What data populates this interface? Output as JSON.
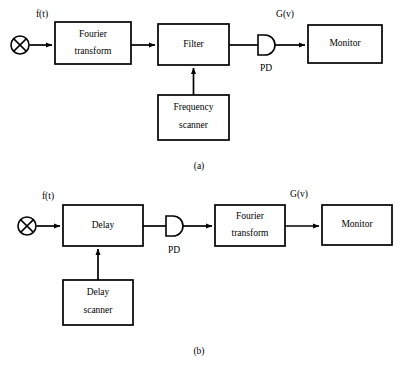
{
  "figure": {
    "type": "block-diagram",
    "background_color": "#ffffff",
    "line_color": "#000000",
    "panels": [
      {
        "id": "a",
        "caption": "(a)",
        "caption_pos": {
          "x": 199,
          "y": 166
        },
        "input_node": {
          "name": "mixer",
          "symbol": "circle-with-x",
          "cx": 20,
          "cy": 45,
          "r": 9
        },
        "input_signal_label": "f(t)",
        "input_signal_label_pos": {
          "x": 42,
          "y": 17
        },
        "output_signal_label": "G(v)",
        "output_signal_label_pos": {
          "x": 285,
          "y": 17
        },
        "detector": {
          "label": "PD",
          "shape": "d-shape",
          "x": 258,
          "y": 35,
          "w": 16,
          "h": 20,
          "label_pos": {
            "x": 266,
            "y": 68
          }
        },
        "blocks": [
          {
            "id": "fourier-transform",
            "lines": [
              "Fourier",
              "transform"
            ],
            "x": 55,
            "y": 22,
            "w": 76,
            "h": 42
          },
          {
            "id": "filter",
            "lines": [
              "Filter"
            ],
            "x": 158,
            "y": 24,
            "w": 71,
            "h": 41
          },
          {
            "id": "frequency-scanner",
            "lines": [
              "Frequency",
              "scanner"
            ],
            "x": 158,
            "y": 95,
            "w": 71,
            "h": 45
          },
          {
            "id": "monitor",
            "lines": [
              "Monitor"
            ],
            "x": 308,
            "y": 25,
            "w": 74,
            "h": 38
          }
        ],
        "connections": [
          {
            "id": "mixer-to-fourier",
            "from": "mixer",
            "to": "fourier-transform",
            "arrow": true
          },
          {
            "id": "fourier-to-filter",
            "from": "fourier-transform",
            "to": "filter",
            "arrow": true
          },
          {
            "id": "filter-to-pd",
            "from": "filter",
            "to": "pd",
            "arrow": false
          },
          {
            "id": "pd-to-monitor",
            "from": "pd",
            "to": "monitor",
            "arrow": true
          },
          {
            "id": "scanner-to-filter",
            "from": "frequency-scanner",
            "to": "filter",
            "arrow": true,
            "direction": "up"
          }
        ]
      },
      {
        "id": "b",
        "caption": "(b)",
        "caption_pos": {
          "x": 199,
          "y": 351
        },
        "input_node": {
          "name": "mixer",
          "symbol": "circle-with-x",
          "cx": 27,
          "cy": 226,
          "r": 9
        },
        "input_signal_label": "f(t)",
        "input_signal_label_pos": {
          "x": 48,
          "y": 199
        },
        "output_signal_label": "G(v)",
        "output_signal_label_pos": {
          "x": 299,
          "y": 197
        },
        "detector": {
          "label": "PD",
          "shape": "d-shape",
          "x": 166,
          "y": 216,
          "w": 16,
          "h": 20,
          "label_pos": {
            "x": 174,
            "y": 250
          }
        },
        "blocks": [
          {
            "id": "delay",
            "lines": [
              "Delay"
            ],
            "x": 63,
            "y": 205,
            "w": 80,
            "h": 41
          },
          {
            "id": "delay-scanner",
            "lines": [
              "Delay",
              "scanner"
            ],
            "x": 63,
            "y": 280,
            "w": 70,
            "h": 45
          },
          {
            "id": "fourier-transform",
            "lines": [
              "Fourier",
              "transform"
            ],
            "x": 215,
            "y": 205,
            "w": 70,
            "h": 41
          },
          {
            "id": "monitor",
            "lines": [
              "Monitor"
            ],
            "x": 322,
            "y": 205,
            "w": 70,
            "h": 40
          }
        ],
        "connections": [
          {
            "id": "mixer-to-delay",
            "from": "mixer",
            "to": "delay",
            "arrow": true
          },
          {
            "id": "delay-to-pd",
            "from": "delay",
            "to": "pd",
            "arrow": false
          },
          {
            "id": "pd-to-fourier",
            "from": "pd",
            "to": "fourier-transform",
            "arrow": true
          },
          {
            "id": "fourier-to-monitor",
            "from": "fourier-transform",
            "to": "monitor",
            "arrow": true
          },
          {
            "id": "scanner-to-delay",
            "from": "delay-scanner",
            "to": "delay",
            "arrow": true,
            "direction": "up"
          }
        ]
      }
    ]
  },
  "text": {
    "panel_a": {
      "fourier_transform_line1": "Fourier",
      "fourier_transform_line2": "transform",
      "filter": "Filter",
      "frequency_scanner_line1": "Frequency",
      "frequency_scanner_line2": "scanner",
      "monitor": "Monitor",
      "pd": "PD",
      "input_signal": "f(t)",
      "output_signal": "G(v)",
      "caption": "(a)"
    },
    "panel_b": {
      "delay": "Delay",
      "delay_scanner_line1": "Delay",
      "delay_scanner_line2": "scanner",
      "fourier_transform_line1": "Fourier",
      "fourier_transform_line2": "transform",
      "monitor": "Monitor",
      "pd": "PD",
      "input_signal": "f(t)",
      "output_signal": "G(v)",
      "caption": "(b)"
    }
  }
}
